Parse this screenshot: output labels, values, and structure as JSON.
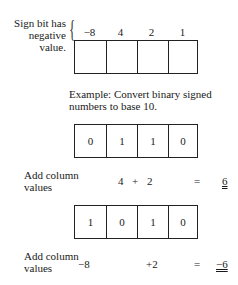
{
  "legend": {
    "sign_note_line1": "Sign bit has",
    "sign_note_line2": "negative value.",
    "weights": [
      "−8",
      "4",
      "2",
      "1"
    ]
  },
  "example_title_line1": "Example: Convert binary signed",
  "example_title_line2": "numbers to base 10.",
  "example1": {
    "bits": [
      "0",
      "1",
      "1",
      "0"
    ],
    "add_label_line1": "Add column",
    "add_label_line2": "values",
    "term1": "4",
    "plus": "+",
    "term2": "2",
    "equals": "=",
    "result": "6"
  },
  "example2": {
    "bits": [
      "1",
      "0",
      "1",
      "0"
    ],
    "add_label_line1": "Add column",
    "add_label_line2": "values",
    "term1": "−8",
    "term2": "+2",
    "equals": "=",
    "result": "−6"
  }
}
